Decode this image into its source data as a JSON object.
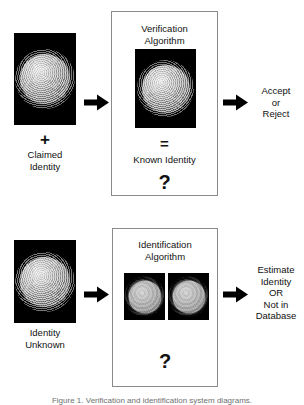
{
  "figure": {
    "background_color": "#ffffff",
    "text_color": "#111111",
    "box_border_color": "#8a8a8a",
    "arrow_color": "#000000",
    "caption": "Figure 1. Verification and identification system diagrams."
  },
  "verification_row": {
    "input_sample": {
      "icon_name": "fingerprint-sample-image",
      "alt": "fingerprint sample"
    },
    "input_label": {
      "plus": "+",
      "line1": "Claimed",
      "line2": "Identity"
    },
    "arrow_in": "arrow-right-icon",
    "process": {
      "title_line1": "Verification",
      "title_line2": "Algorithm",
      "stored_sample": {
        "icon_name": "fingerprint-template-image",
        "alt": "stored fingerprint template"
      },
      "equals": "=",
      "known_identity": "Known Identity",
      "question": "?"
    },
    "arrow_out": "arrow-right-icon",
    "output_label": {
      "line1": "Accept",
      "line2": "or",
      "line3": "Reject"
    }
  },
  "identification_row": {
    "input_sample": {
      "icon_name": "fingerprint-sample-image",
      "alt": "fingerprint sample"
    },
    "input_label": {
      "line1": "Identity",
      "line2": "Unknown"
    },
    "arrow_in": "arrow-right-icon",
    "process": {
      "title_line1": "Identification",
      "title_line2": "Algorithm",
      "candidate_a": {
        "icon_name": "fingerprint-candidate-image",
        "alt": "database candidate fingerprint 1"
      },
      "candidate_b": {
        "icon_name": "fingerprint-candidate-image",
        "alt": "database candidate fingerprint 2"
      },
      "question": "?"
    },
    "arrow_out": "arrow-right-icon",
    "output_label": {
      "line1": "Estimate",
      "line2": "Identity",
      "line3": "OR",
      "line4": "Not in",
      "line5": "Database"
    }
  }
}
